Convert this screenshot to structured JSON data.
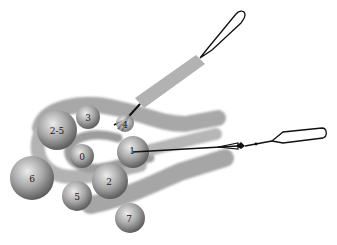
{
  "diagram": {
    "colors": {
      "band": "#a9a9a9",
      "band_edge": "#8c8c8c",
      "sphere_light": "#e2e2e2",
      "sphere_dark": "#6e6e6e",
      "wire": "#111111",
      "sleeve": "#b0b0b0"
    },
    "spheres": [
      {
        "id": "sphere-2-5",
        "label": "2-5",
        "cx": 57,
        "cy": 130,
        "r": 20
      },
      {
        "id": "sphere-3",
        "label": "3",
        "cx": 88,
        "cy": 117,
        "r": 12
      },
      {
        "id": "sphere-4",
        "label": "4",
        "cx": 125,
        "cy": 123,
        "r": 9
      },
      {
        "id": "sphere-0",
        "label": "0",
        "cx": 82,
        "cy": 156,
        "r": 12
      },
      {
        "id": "sphere-1",
        "label": "1",
        "cx": 133,
        "cy": 152,
        "r": 16
      },
      {
        "id": "sphere-6",
        "label": "6",
        "cx": 32,
        "cy": 178,
        "r": 22
      },
      {
        "id": "sphere-5",
        "label": "5",
        "cx": 77,
        "cy": 196,
        "r": 15
      },
      {
        "id": "sphere-2",
        "label": "2",
        "cx": 110,
        "cy": 181,
        "r": 18
      },
      {
        "id": "sphere-7",
        "label": "7",
        "cx": 130,
        "cy": 218,
        "r": 15
      }
    ],
    "tools": [
      {
        "id": "upper-loop-instrument",
        "description": "snare loop with grey sleeve, pointing to sphere 4"
      },
      {
        "id": "right-loop-instrument",
        "description": "snare loop with wire attached to sphere 1"
      }
    ]
  }
}
